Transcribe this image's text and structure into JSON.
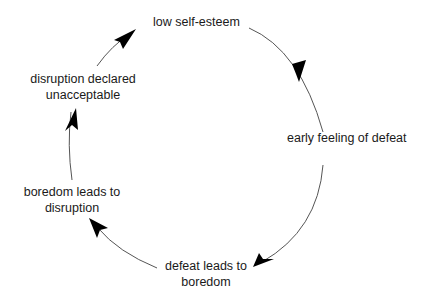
{
  "diagram": {
    "type": "cycle",
    "nodes": [
      {
        "id": "n1",
        "line1": "low self-esteem",
        "line2": ""
      },
      {
        "id": "n2",
        "line1": "early feeling of defeat",
        "line2": ""
      },
      {
        "id": "n3",
        "line1": "defeat leads to",
        "line2": "boredom"
      },
      {
        "id": "n4",
        "line1": "boredom leads to",
        "line2": "disruption"
      },
      {
        "id": "n5",
        "line1": "disruption declared",
        "line2": "unacceptable"
      }
    ],
    "edges": [
      {
        "from": "n1",
        "to": "n2"
      },
      {
        "from": "n2",
        "to": "n3"
      },
      {
        "from": "n3",
        "to": "n4"
      },
      {
        "from": "n4",
        "to": "n5"
      },
      {
        "from": "n5",
        "to": "n1"
      }
    ],
    "colors": {
      "line": "#555555",
      "arrowhead": "#000000",
      "text": "#1a1a1a",
      "background": "#ffffff"
    }
  }
}
